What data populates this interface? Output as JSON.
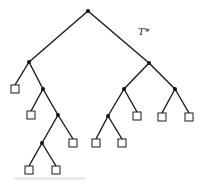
{
  "diagram": {
    "type": "binary-tree",
    "label": "T*",
    "label_position": {
      "x": 138,
      "y": 35
    },
    "colors": {
      "line": "#1a1a1a",
      "node": "#111111",
      "leaf_fill": "#ffffff"
    },
    "internal_nodes": [
      {
        "id": "n0",
        "x": 88,
        "y": 11
      },
      {
        "id": "n1",
        "x": 29,
        "y": 62
      },
      {
        "id": "n2",
        "x": 43,
        "y": 89
      },
      {
        "id": "n3",
        "x": 58,
        "y": 115
      },
      {
        "id": "n4",
        "x": 42,
        "y": 143
      },
      {
        "id": "n5",
        "x": 149,
        "y": 63
      },
      {
        "id": "n6",
        "x": 124,
        "y": 89
      },
      {
        "id": "n7",
        "x": 108,
        "y": 116
      },
      {
        "id": "n8",
        "x": 175,
        "y": 89
      }
    ],
    "leaves": [
      {
        "id": "l0",
        "x": 15,
        "y": 89
      },
      {
        "id": "l1",
        "x": 31,
        "y": 115
      },
      {
        "id": "l2",
        "x": 73,
        "y": 143
      },
      {
        "id": "l3",
        "x": 29,
        "y": 170
      },
      {
        "id": "l4",
        "x": 56,
        "y": 170
      },
      {
        "id": "l5",
        "x": 137,
        "y": 116
      },
      {
        "id": "l6",
        "x": 96,
        "y": 143
      },
      {
        "id": "l7",
        "x": 122,
        "y": 143
      },
      {
        "id": "l8",
        "x": 162,
        "y": 117
      },
      {
        "id": "l9",
        "x": 189,
        "y": 117
      }
    ],
    "edges": [
      [
        "n0",
        "n1"
      ],
      [
        "n0",
        "n5"
      ],
      [
        "n1",
        "l0"
      ],
      [
        "n1",
        "n2"
      ],
      [
        "n2",
        "l1"
      ],
      [
        "n2",
        "n3"
      ],
      [
        "n3",
        "n4"
      ],
      [
        "n3",
        "l2"
      ],
      [
        "n4",
        "l3"
      ],
      [
        "n4",
        "l4"
      ],
      [
        "n5",
        "n6"
      ],
      [
        "n5",
        "n8"
      ],
      [
        "n6",
        "n7"
      ],
      [
        "n6",
        "l5"
      ],
      [
        "n7",
        "l6"
      ],
      [
        "n7",
        "l7"
      ],
      [
        "n8",
        "l8"
      ],
      [
        "n8",
        "l9"
      ]
    ],
    "leaf_size": 8,
    "node_radius": 2
  }
}
